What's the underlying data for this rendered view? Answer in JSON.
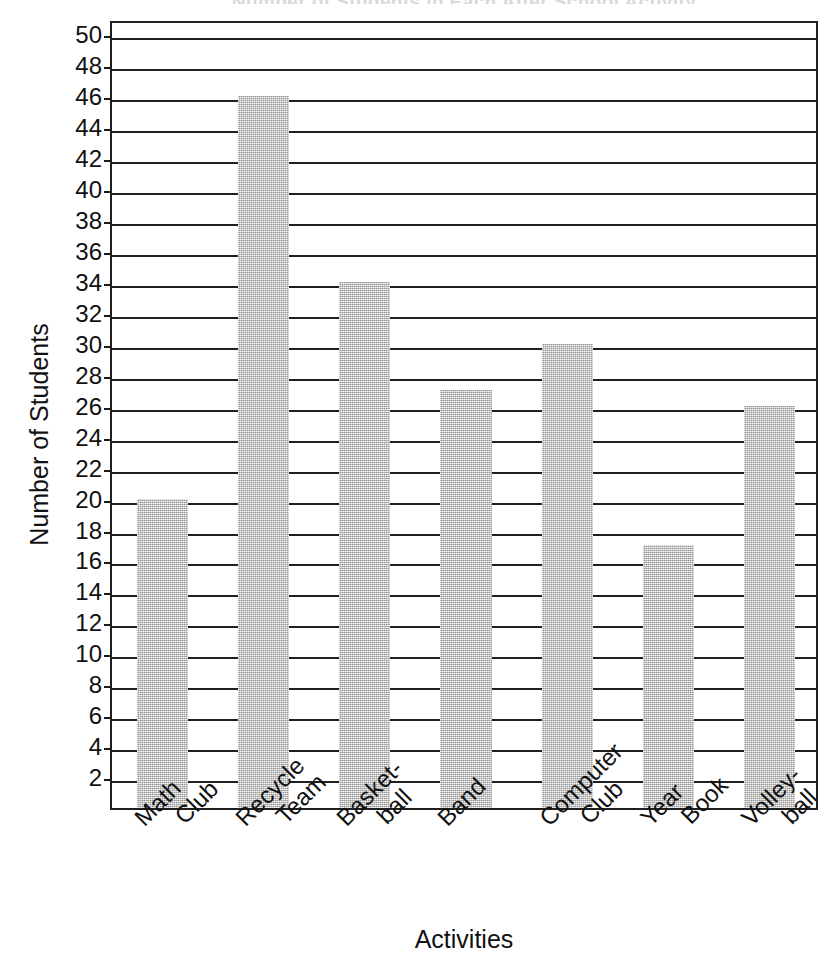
{
  "chart_data": {
    "type": "bar",
    "title": "Number of Students in Each After School Activity",
    "xlabel": "Activities",
    "ylabel": "Number of Students",
    "categories": [
      "Math Club",
      "Recycle Team",
      "Basket-ball",
      "Band",
      "Computer Club",
      "Year Book",
      "Volley-ball"
    ],
    "category_lines": [
      [
        "Math",
        "Club"
      ],
      [
        "Recycle",
        "Team"
      ],
      [
        "Basket-",
        "ball"
      ],
      [
        "Band",
        ""
      ],
      [
        "Computer",
        "Club"
      ],
      [
        "Year",
        "Book"
      ],
      [
        "Volley-",
        "ball"
      ]
    ],
    "values": [
      20,
      46,
      34,
      27,
      30,
      17,
      26
    ],
    "ylim": [
      0,
      51
    ],
    "ytick_labels": [
      "50",
      "48",
      "46",
      "44",
      "42",
      "40",
      "38",
      "36",
      "34",
      "32",
      "30",
      "28",
      "26",
      "24",
      "22",
      "20",
      "18",
      "16",
      "14",
      "12",
      "10",
      "8",
      "6",
      "4",
      "2"
    ],
    "ytick_values": [
      50,
      48,
      46,
      44,
      42,
      40,
      38,
      36,
      34,
      32,
      30,
      28,
      26,
      24,
      22,
      20,
      18,
      16,
      14,
      12,
      10,
      8,
      6,
      4,
      2
    ],
    "ytick_step": 2,
    "grid": true,
    "legend": false,
    "legend_position": "none",
    "bar_color": "#b9b9b9",
    "axis_color": "#1f1f1f"
  }
}
